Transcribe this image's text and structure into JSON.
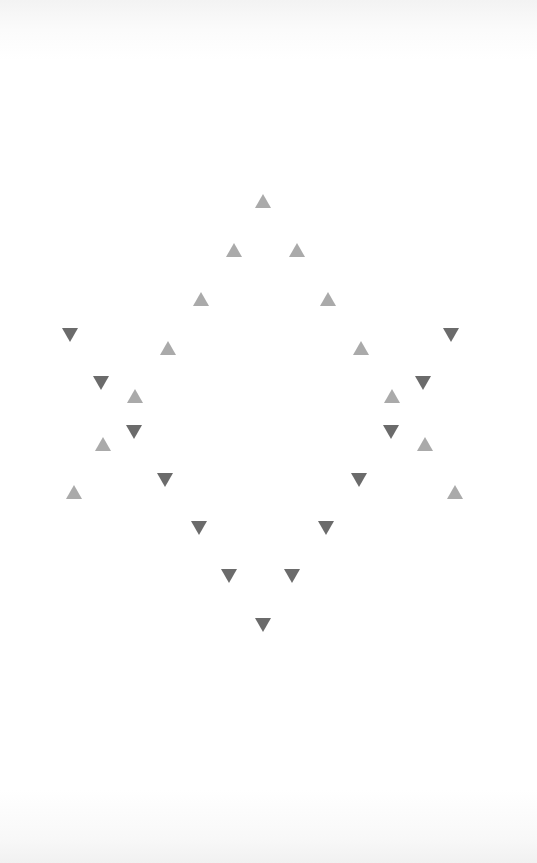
{
  "figure": {
    "colors": {
      "up": "#aaaaaa",
      "down": "#6b6b6b",
      "background": "#ffffff"
    },
    "triangles": [
      {
        "dir": "up",
        "x": 263,
        "y": 201
      },
      {
        "dir": "up",
        "x": 234,
        "y": 250
      },
      {
        "dir": "up",
        "x": 297,
        "y": 250
      },
      {
        "dir": "up",
        "x": 201,
        "y": 299
      },
      {
        "dir": "up",
        "x": 328,
        "y": 299
      },
      {
        "dir": "up",
        "x": 168,
        "y": 348
      },
      {
        "dir": "up",
        "x": 361,
        "y": 348
      },
      {
        "dir": "up",
        "x": 135,
        "y": 396
      },
      {
        "dir": "up",
        "x": 392,
        "y": 396
      },
      {
        "dir": "up",
        "x": 103,
        "y": 444
      },
      {
        "dir": "up",
        "x": 425,
        "y": 444
      },
      {
        "dir": "up",
        "x": 74,
        "y": 492
      },
      {
        "dir": "up",
        "x": 455,
        "y": 492
      },
      {
        "dir": "down",
        "x": 70,
        "y": 335
      },
      {
        "dir": "down",
        "x": 451,
        "y": 335
      },
      {
        "dir": "down",
        "x": 101,
        "y": 383
      },
      {
        "dir": "down",
        "x": 423,
        "y": 383
      },
      {
        "dir": "down",
        "x": 134,
        "y": 432
      },
      {
        "dir": "down",
        "x": 391,
        "y": 432
      },
      {
        "dir": "down",
        "x": 165,
        "y": 480
      },
      {
        "dir": "down",
        "x": 359,
        "y": 480
      },
      {
        "dir": "down",
        "x": 199,
        "y": 528
      },
      {
        "dir": "down",
        "x": 326,
        "y": 528
      },
      {
        "dir": "down",
        "x": 229,
        "y": 576
      },
      {
        "dir": "down",
        "x": 292,
        "y": 576
      },
      {
        "dir": "down",
        "x": 263,
        "y": 625
      }
    ]
  }
}
